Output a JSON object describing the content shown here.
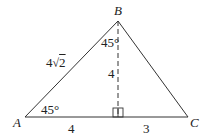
{
  "diagram": {
    "type": "triangle",
    "vertices": [
      {
        "name": "A",
        "x": 25,
        "y": 117
      },
      {
        "name": "B",
        "x": 118,
        "y": 21
      },
      {
        "name": "C",
        "x": 188,
        "y": 117
      }
    ],
    "altitude": {
      "from": "B",
      "foot_x": 118,
      "foot_y": 117,
      "style": "dashed",
      "right_angle_marker": true
    },
    "labels": {
      "A": "A",
      "B": "B",
      "C": "C",
      "side_AB": "4√2",
      "side_AB_coef": "4",
      "side_AB_rad": "2",
      "altitude_length": "4",
      "segment_A_foot": "4",
      "segment_foot_C": "3",
      "angle_A": "45°",
      "angle_B_part": "45°"
    },
    "colors": {
      "line": "#333333",
      "text": "#222222"
    }
  }
}
